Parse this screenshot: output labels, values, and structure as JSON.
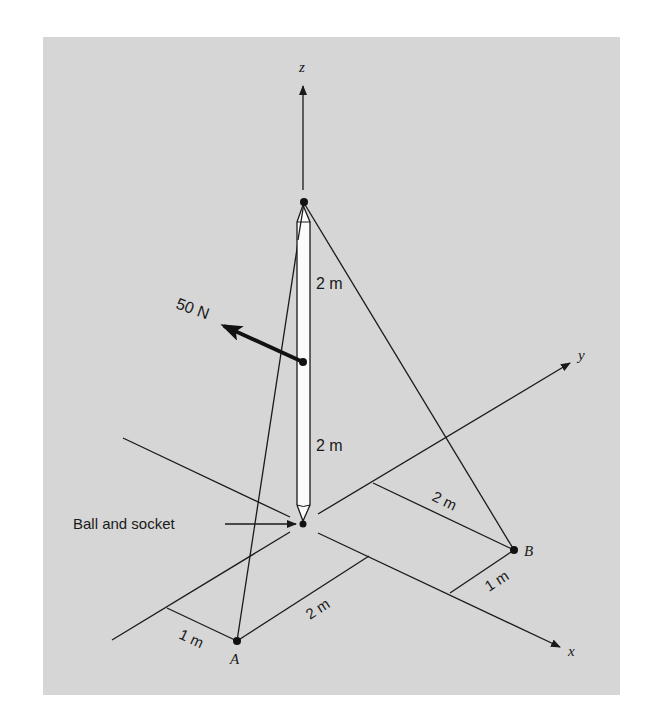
{
  "figure": {
    "background": "#ffffff",
    "panel_color": "#d6d6d6",
    "ink_color": "#1a1a1a",
    "pole_fill": "#fbfbfb"
  },
  "axes": {
    "z_label": "z",
    "y_label": "y",
    "x_label": "x"
  },
  "points": {
    "a_label": "A",
    "b_label": "B"
  },
  "force": {
    "label": "50 N"
  },
  "pole": {
    "upper_segment_label": "2 m",
    "lower_segment_label": "2 m"
  },
  "support": {
    "label": "Ball and socket"
  },
  "dimensions": {
    "a_to_neg_x_axis": "1 m",
    "a_to_x_axis": "2 m",
    "b_to_y_axis": "2 m",
    "b_to_x_axis": "1 m"
  }
}
